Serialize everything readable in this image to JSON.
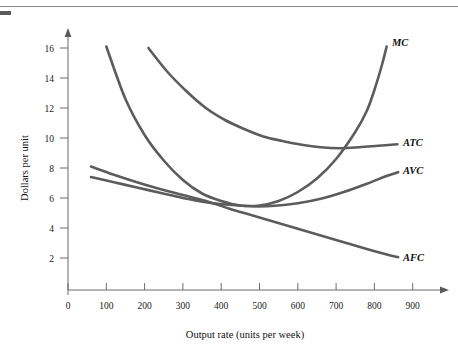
{
  "figure": {
    "has_top_rule": true,
    "corner_mark": "page-edge-mark"
  },
  "chart_data": {
    "type": "line",
    "title": "",
    "xlabel": "Output rate (units per week)",
    "ylabel": "Dollars per unit",
    "xlim": [
      0,
      950
    ],
    "ylim": [
      0,
      17.5
    ],
    "grid": false,
    "legend": "inline-right-labels",
    "xticks": [
      0,
      100,
      200,
      300,
      400,
      500,
      600,
      700,
      800,
      900
    ],
    "xtick_labels": [
      "0",
      "100",
      "200",
      "300",
      "400",
      "500",
      "600",
      "700",
      "800",
      "900"
    ],
    "yticks": [
      2,
      4,
      6,
      8,
      10,
      12,
      14,
      16
    ],
    "ytick_labels": [
      "2",
      "4",
      "6",
      "8",
      "10",
      "12",
      "14",
      "16"
    ],
    "series": [
      {
        "name": "MC",
        "label": "MC",
        "label_x": 830,
        "label_y": 16.2,
        "color": "#5c5c5c",
        "points": [
          [
            100,
            16.1
          ],
          [
            150,
            12.6
          ],
          [
            200,
            10.2
          ],
          [
            250,
            8.5
          ],
          [
            300,
            7.2
          ],
          [
            350,
            6.3
          ],
          [
            400,
            5.8
          ],
          [
            450,
            5.5
          ],
          [
            500,
            5.5
          ],
          [
            550,
            5.8
          ],
          [
            600,
            6.4
          ],
          [
            650,
            7.3
          ],
          [
            700,
            8.6
          ],
          [
            750,
            10.4
          ],
          [
            780,
            11.8
          ],
          [
            800,
            13.2
          ],
          [
            820,
            14.9
          ],
          [
            832,
            16.1
          ]
        ]
      },
      {
        "name": "ATC",
        "label": "ATC",
        "label_x": 885,
        "label_y": 9.6,
        "color": "#5c5c5c",
        "points": [
          [
            210,
            16.0
          ],
          [
            260,
            14.4
          ],
          [
            310,
            13.1
          ],
          [
            360,
            12.0
          ],
          [
            410,
            11.2
          ],
          [
            460,
            10.6
          ],
          [
            510,
            10.1
          ],
          [
            560,
            9.8
          ],
          [
            610,
            9.55
          ],
          [
            660,
            9.38
          ],
          [
            710,
            9.32
          ],
          [
            760,
            9.38
          ],
          [
            810,
            9.48
          ],
          [
            860,
            9.58
          ]
        ]
      },
      {
        "name": "AVC",
        "label": "AVC",
        "label_x": 885,
        "label_y": 7.7,
        "color": "#5c5c5c",
        "points": [
          [
            60,
            7.4
          ],
          [
            120,
            7.05
          ],
          [
            180,
            6.7
          ],
          [
            240,
            6.35
          ],
          [
            300,
            6.0
          ],
          [
            360,
            5.72
          ],
          [
            420,
            5.55
          ],
          [
            480,
            5.45
          ],
          [
            540,
            5.48
          ],
          [
            600,
            5.65
          ],
          [
            660,
            5.95
          ],
          [
            720,
            6.4
          ],
          [
            780,
            6.95
          ],
          [
            830,
            7.45
          ],
          [
            862,
            7.72
          ]
        ]
      },
      {
        "name": "AFC",
        "label": "AFC",
        "label_x": 885,
        "label_y": 2.0,
        "color": "#5c5c5c",
        "points": [
          [
            60,
            8.1
          ],
          [
            120,
            7.55
          ],
          [
            180,
            7.05
          ],
          [
            240,
            6.6
          ],
          [
            300,
            6.2
          ],
          [
            360,
            5.8
          ],
          [
            420,
            5.3
          ],
          [
            480,
            4.85
          ],
          [
            540,
            4.4
          ],
          [
            600,
            3.95
          ],
          [
            660,
            3.5
          ],
          [
            720,
            3.05
          ],
          [
            780,
            2.6
          ],
          [
            830,
            2.25
          ],
          [
            862,
            2.05
          ]
        ]
      }
    ],
    "annotations": []
  }
}
